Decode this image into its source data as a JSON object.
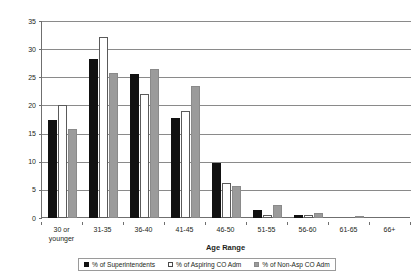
{
  "chart_data": {
    "type": "bar",
    "title": "",
    "xlabel": "Age Range",
    "ylabel": "",
    "ylim": [
      0,
      35
    ],
    "ytick_step": 5,
    "yticks": [
      0,
      5,
      10,
      15,
      20,
      25,
      30,
      35
    ],
    "grid": true,
    "legend_position": "bottom",
    "categories": [
      "30 or\nyounger",
      "31-35",
      "36-40",
      "41-45",
      "46-50",
      "51-55",
      "56-60",
      "61-65",
      "66+"
    ],
    "category_labels": [
      [
        "30 or",
        "younger"
      ],
      [
        "31-35"
      ],
      [
        "36-40"
      ],
      [
        "41-45"
      ],
      [
        "46-50"
      ],
      [
        "51-55"
      ],
      [
        "56-60"
      ],
      [
        "61-65"
      ],
      [
        "66+"
      ]
    ],
    "series": [
      {
        "name": "% of Superintendents",
        "color": "#111111",
        "values": [
          17.5,
          28.3,
          25.6,
          17.7,
          9.7,
          1.4,
          0.5,
          0,
          0
        ]
      },
      {
        "name": "% of Aspiring CO Adm",
        "color": "#ffffff",
        "values": [
          20.0,
          32.2,
          22.0,
          19.0,
          6.2,
          0.6,
          0.5,
          0,
          0
        ]
      },
      {
        "name": "% of Non-Asp CO Adm",
        "color": "#9b9b9b",
        "values": [
          15.8,
          25.7,
          26.4,
          23.4,
          5.7,
          2.3,
          0.9,
          0.3,
          0
        ]
      }
    ]
  },
  "axis": {
    "x_title": "Age Range"
  },
  "legend": {
    "items": [
      {
        "label": "% of Superintendents",
        "swatch": "black-square-swatch"
      },
      {
        "label": "% of Aspiring CO Adm",
        "swatch": "white-square-swatch"
      },
      {
        "label": "% of Non-Asp CO Adm",
        "swatch": "gray-square-swatch"
      }
    ]
  },
  "colors": {
    "series_superintendents": "#111111",
    "series_aspiring": "#ffffff",
    "series_non_aspiring": "#9b9b9b",
    "gridline": "#8a8a8a",
    "axis": "#6f6f6f",
    "text": "#231f20"
  }
}
